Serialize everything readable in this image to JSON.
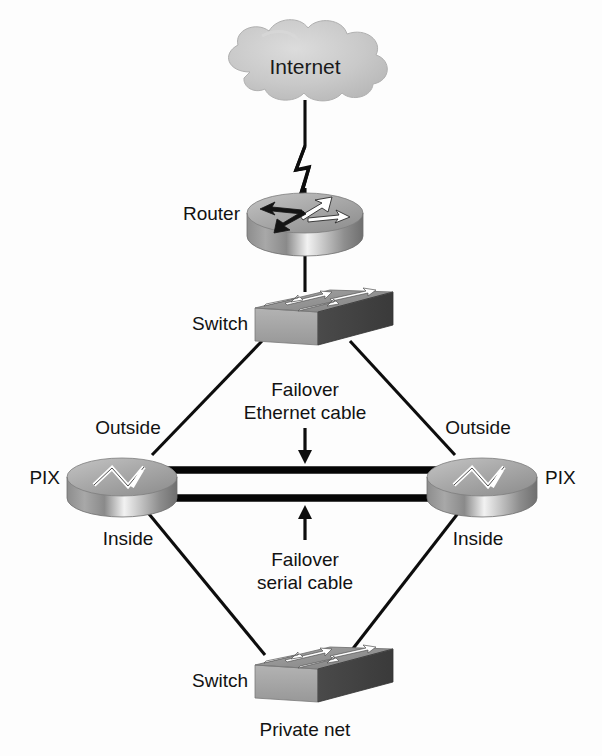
{
  "diagram": {
    "background_color": "#fdfdfd",
    "line_color": "#0d0d0d",
    "text_color": "#121212",
    "device_gray_light": "#e2e2e2",
    "device_gray_mid": "#9a9a9a",
    "device_gray_dark": "#5f5f5f",
    "cloud_label": "Internet",
    "nodes": {
      "internet": {
        "label": "Internet",
        "type": "cloud",
        "x": 305,
        "y": 66
      },
      "router": {
        "label": "Router",
        "type": "router",
        "x": 305,
        "y": 213
      },
      "switch_top": {
        "label": "Switch",
        "type": "switch",
        "x": 305,
        "y": 315
      },
      "pix_left": {
        "label": "PIX",
        "type": "firewall",
        "x": 122,
        "y": 477,
        "iface_top": "Outside",
        "iface_bottom": "Inside"
      },
      "pix_right": {
        "label": "PIX",
        "type": "firewall",
        "x": 482,
        "y": 477,
        "iface_top": "Outside",
        "iface_bottom": "Inside"
      },
      "switch_bottom": {
        "label": "Switch",
        "type": "switch",
        "x": 305,
        "y": 672,
        "caption": "Private net"
      }
    },
    "labels": {
      "internet": "Internet",
      "router": "Router",
      "switch_top": "Switch",
      "pix_left": "PIX",
      "pix_right": "PIX",
      "outside_left": "Outside",
      "inside_left": "Inside",
      "outside_right": "Outside",
      "inside_right": "Inside",
      "switch_bottom": "Switch",
      "private_net": "Private net"
    },
    "callouts": [
      {
        "id": "failover-ethernet",
        "line1": "Failover",
        "line2": "Ethernet cable",
        "arrow": "down",
        "x": 305,
        "y": 410
      },
      {
        "id": "failover-serial",
        "line1": "Failover",
        "line2": "serial cable",
        "arrow": "up",
        "x": 305,
        "y": 560
      }
    ],
    "links": [
      {
        "from": "internet",
        "to": "router",
        "style": "lightning"
      },
      {
        "from": "router",
        "to": "switch_top",
        "style": "solid"
      },
      {
        "from": "switch_top",
        "to": "pix_left",
        "style": "solid"
      },
      {
        "from": "switch_top",
        "to": "pix_right",
        "style": "solid"
      },
      {
        "from": "pix_left",
        "to": "pix_right",
        "style": "double-thick"
      },
      {
        "from": "pix_left",
        "to": "switch_bottom",
        "style": "solid"
      },
      {
        "from": "pix_right",
        "to": "switch_bottom",
        "style": "solid"
      }
    ]
  }
}
